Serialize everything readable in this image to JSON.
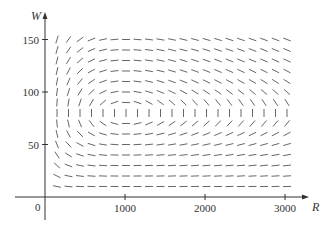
{
  "chart_data": {
    "type": "direction_field",
    "title": "",
    "xlabel": "R",
    "ylabel": "W",
    "origin_label": "0",
    "xlim": [
      0,
      3250
    ],
    "ylim": [
      0,
      175
    ],
    "x_ticks": [
      1000,
      2000,
      3000
    ],
    "x_tick_labels": [
      "1000",
      "2000",
      "3000"
    ],
    "y_ticks": [
      50,
      100,
      150
    ],
    "y_tick_labels": [
      "50",
      "100",
      "150"
    ],
    "grid": false,
    "legend": null,
    "system": {
      "dR_dt": "0.08*R - 0.001*R*W",
      "dW_dt": "-0.02*W + 0.00002*R*W",
      "a": 0.08,
      "b": 0.001,
      "c": 0.02,
      "d": 2e-05
    },
    "equilibrium": {
      "R": 1000,
      "W": 80
    },
    "sample_grid": {
      "R_start": 150,
      "R_step": 143.75,
      "R_count": 21,
      "W_start": 10,
      "W_step": 10,
      "W_count": 15
    },
    "colors": {
      "axis": "#333333",
      "segment": "#555555"
    }
  }
}
